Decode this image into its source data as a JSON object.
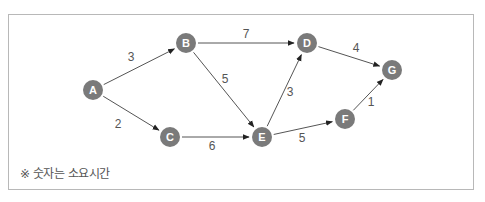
{
  "diagram": {
    "title": "",
    "nodes": [
      {
        "id": "A",
        "label": "A",
        "x": 93,
        "y": 90
      },
      {
        "id": "B",
        "label": "B",
        "x": 186,
        "y": 43
      },
      {
        "id": "C",
        "label": "C",
        "x": 170,
        "y": 137
      },
      {
        "id": "D",
        "label": "D",
        "x": 307,
        "y": 43
      },
      {
        "id": "E",
        "label": "E",
        "x": 262,
        "y": 137
      },
      {
        "id": "F",
        "label": "F",
        "x": 345,
        "y": 119
      },
      {
        "id": "G",
        "label": "G",
        "x": 392,
        "y": 70
      }
    ],
    "edges": [
      {
        "from": "A",
        "to": "B",
        "weight": "3",
        "lx": 131,
        "ly": 61
      },
      {
        "from": "A",
        "to": "C",
        "weight": "2",
        "lx": 118,
        "ly": 128
      },
      {
        "from": "B",
        "to": "D",
        "weight": "7",
        "lx": 246,
        "ly": 38
      },
      {
        "from": "B",
        "to": "E",
        "weight": "5",
        "lx": 225,
        "ly": 83
      },
      {
        "from": "C",
        "to": "E",
        "weight": "6",
        "lx": 212,
        "ly": 150
      },
      {
        "from": "E",
        "to": "D",
        "weight": "3",
        "lx": 290,
        "ly": 96
      },
      {
        "from": "D",
        "to": "G",
        "weight": "4",
        "lx": 356,
        "ly": 52
      },
      {
        "from": "E",
        "to": "F",
        "weight": "5",
        "lx": 302,
        "ly": 142
      },
      {
        "from": "F",
        "to": "G",
        "weight": "1",
        "lx": 371,
        "ly": 106
      }
    ],
    "note": "※ 숫자는 소요시간",
    "colors": {
      "node": "#7a7a7a",
      "node_text": "#ffffff",
      "edge": "#555555",
      "label": "#555555",
      "border": "#b8b8b8"
    }
  }
}
